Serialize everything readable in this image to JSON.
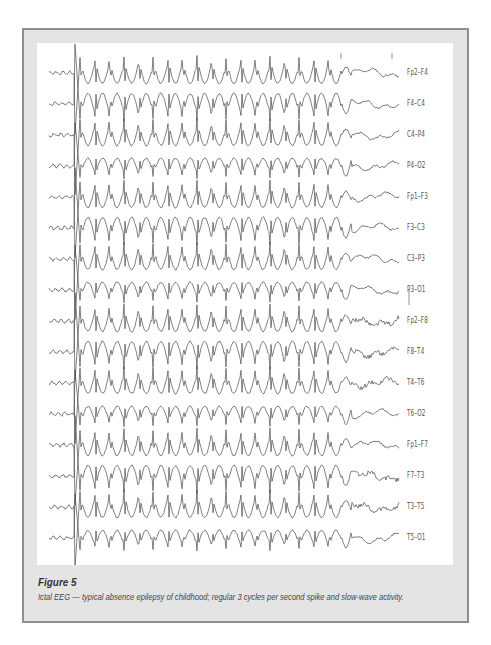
{
  "figure": {
    "title": "Figure 5",
    "caption": "Ictal EEG — typical absence epilepsy of childhood; regular 3 cycles per second spike and slow-wave activity.",
    "colors": {
      "frame_border": "#8f8f8f",
      "frame_background": "#e4e4e4",
      "plot_background": "#ffffff",
      "trace": "#4a4a4a"
    }
  },
  "eeg": {
    "channels": [
      "Fp2–F4",
      "F4–C4",
      "C4–P4",
      "P4–O2",
      "Fp1–F3",
      "F3–C3",
      "C3–P3",
      "P3–O1",
      "Fp2–F8",
      "F8–T4",
      "T4–T6",
      "T6–O2",
      "Fp1–F7",
      "F7–T3",
      "T3–T5",
      "T5–O1"
    ],
    "discharge": {
      "pattern": "spike and slow-wave",
      "frequency_hz": 3
    }
  }
}
